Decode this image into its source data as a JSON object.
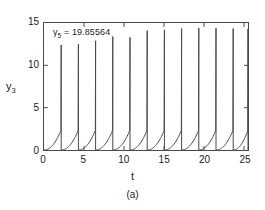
{
  "chart_data": {
    "type": "line",
    "title": "",
    "subtitle": "",
    "xlabel": "t",
    "ylabel": "y3",
    "ylabel_display": "y",
    "ylabel_sub": "3",
    "xlim": [
      0,
      25.5
    ],
    "ylim": [
      0,
      15
    ],
    "xticks": [
      0,
      5,
      10,
      15,
      20,
      25
    ],
    "yticks": [
      0,
      5,
      10,
      15
    ],
    "xtick_labels": [
      "0",
      "5",
      "10",
      "15",
      "20",
      "25"
    ],
    "ytick_labels": [
      "0",
      "5",
      "10",
      "15"
    ],
    "grid": false,
    "legend": null,
    "line_color": "#4a4a4a",
    "frame_color": "#4a4a4a",
    "background": "#ffffff",
    "annotations": [
      {
        "name": "gamma5-annotation",
        "symbol": "γ",
        "subscript": "5",
        "equals": "=",
        "value": "19.85564",
        "text": "γ5 = 19.85564",
        "x": 2.0,
        "y": 14.1
      }
    ],
    "series": [
      {
        "name": "y3(t)",
        "spike_count": 12,
        "period": 2.15,
        "baseline": 0.0,
        "shoulder": 2.3,
        "spike_times": [
          2.15,
          4.3,
          6.45,
          8.6,
          10.75,
          12.9,
          15.05,
          17.2,
          19.35,
          21.5,
          23.65,
          25.5
        ],
        "peak_values": [
          12.4,
          12.5,
          12.9,
          13.4,
          13.3,
          14.1,
          14.2,
          14.35,
          14.4,
          14.4,
          14.35,
          14.3
        ]
      }
    ]
  },
  "figure": {
    "caption": "(a)"
  }
}
